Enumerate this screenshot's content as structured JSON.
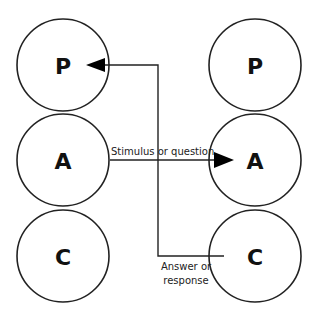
{
  "diagram": {
    "left_column": {
      "circles": [
        {
          "letter": "P",
          "cx": 63,
          "cy": 65
        },
        {
          "letter": "A",
          "cx": 63,
          "cy": 160
        },
        {
          "letter": "C",
          "cx": 63,
          "cy": 256
        }
      ]
    },
    "right_column": {
      "circles": [
        {
          "letter": "P",
          "cx": 255,
          "cy": 65
        },
        {
          "letter": "A",
          "cx": 255,
          "cy": 160
        },
        {
          "letter": "C",
          "cx": 255,
          "cy": 256
        }
      ]
    },
    "radius": 46,
    "arrows": [
      {
        "from": "left-A",
        "to": "right-A",
        "label": "Stimulus or question"
      },
      {
        "from": "right-C",
        "to": "left-P",
        "label_line1": "Answer or",
        "label_line2": "response"
      }
    ],
    "colors": {
      "stroke": "#222222",
      "text": "#111111",
      "background": "#ffffff"
    }
  }
}
